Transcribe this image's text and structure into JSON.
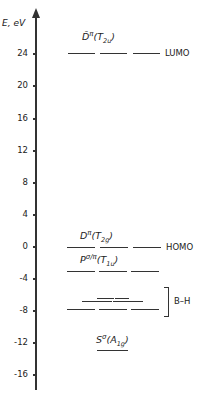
{
  "axis": {
    "label": "E, eV",
    "ticks": [
      {
        "label": "24",
        "y": 53
      },
      {
        "label": "20",
        "y": 85
      },
      {
        "label": "16",
        "y": 118
      },
      {
        "label": "12",
        "y": 150
      },
      {
        "label": "8",
        "y": 182
      },
      {
        "label": "4",
        "y": 214
      },
      {
        "label": "0",
        "y": 246
      },
      {
        "label": "-4",
        "y": 278
      },
      {
        "label": "-8",
        "y": 310
      },
      {
        "label": "-12",
        "y": 342
      },
      {
        "label": "-16",
        "y": 374
      }
    ]
  },
  "levels": {
    "lumo": {
      "symbol": "D̄",
      "sup": "π",
      "sym_open": "(T",
      "sub": "2u",
      "sym_close": ")",
      "side_label": "LUMO",
      "energy": 24
    },
    "homo": {
      "symbol": "D",
      "sup": "π",
      "sym_open": "(T",
      "sub": "2g",
      "sym_close": ")",
      "side_label": "HOMO",
      "energy": 0
    },
    "p": {
      "symbol": "P",
      "sup": "σ/π",
      "sym_open": "(T",
      "sub": "1u",
      "sym_close": ")",
      "energy": -3
    },
    "bh": {
      "side_label": "B–H",
      "energy_range": [
        -8,
        -6.5
      ]
    },
    "s": {
      "symbol": "S",
      "sup": "σ",
      "sym_open": "(A",
      "sub": "1g",
      "sym_close": ")",
      "energy": -13
    }
  },
  "chart_data": {
    "type": "energy-level-diagram",
    "ylabel": "E, eV",
    "yticks": [
      24,
      20,
      16,
      12,
      8,
      4,
      0,
      -4,
      -8,
      -12,
      -16
    ],
    "ylim": [
      -18,
      28
    ],
    "levels": [
      {
        "label": "D̄π(T2u)",
        "energy": 24,
        "degeneracy": 3,
        "annotation": "LUMO"
      },
      {
        "label": "Dπ(T2g)",
        "energy": 0,
        "degeneracy": 3,
        "annotation": "HOMO"
      },
      {
        "label": "Pσ/π(T1u)",
        "energy": -3,
        "degeneracy": 3
      },
      {
        "label": "B–H",
        "energy": -8,
        "degeneracy": 3,
        "annotation": "B–H"
      },
      {
        "label": "B–H (upper)",
        "energy": -7,
        "degeneracy": 2
      },
      {
        "label": "B–H (top)",
        "energy": -6.5,
        "degeneracy": 2
      },
      {
        "label": "Sσ(A1g)",
        "energy": -13,
        "degeneracy": 1
      }
    ]
  }
}
